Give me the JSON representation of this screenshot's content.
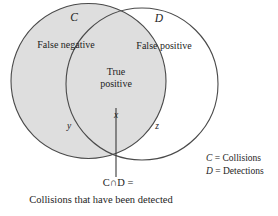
{
  "figure": {
    "type": "venn-diagram",
    "sets": [
      {
        "id": "C",
        "letter": "C",
        "name": "Collisions",
        "filled": true,
        "fill_color": "#dedede",
        "stroke_color": "#4a4a4a",
        "exclusive_region_label": "False negative",
        "exclusive_region_variable": "y"
      },
      {
        "id": "D",
        "letter": "D",
        "name": "Detections",
        "filled": false,
        "fill_color": "#ffffff",
        "stroke_color": "#4a4a4a",
        "exclusive_region_label": "False positive",
        "exclusive_region_variable": "z"
      }
    ],
    "intersection": {
      "label_line1": "True",
      "label_line2": "positive",
      "variable": "x"
    },
    "legend": [
      {
        "symbol": "C",
        "separator": " = ",
        "meaning": "Collisions"
      },
      {
        "symbol": "D",
        "separator": " = ",
        "meaning": "Detections"
      }
    ],
    "caption": {
      "operation": "C∩D =",
      "description": "Collisions that have been detected"
    },
    "colors": {
      "background": "#ffffff",
      "stroke": "#4a4a4a",
      "shaded_fill": "#dedede",
      "text": "#1d1d1d",
      "leader_line": "#3a3a3a"
    }
  }
}
